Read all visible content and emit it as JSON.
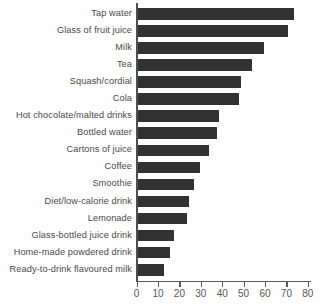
{
  "chart_data": {
    "type": "bar",
    "orientation": "horizontal",
    "title": "",
    "xlabel": "",
    "ylabel": "",
    "categories": [
      "Tap water",
      "Glass of fruit juice",
      "Milk",
      "Tea",
      "Squash/cordial",
      "Cola",
      "Hot chocolate/malted drinks",
      "Bottled water",
      "Cartons of juice",
      "Coffee",
      "Smoothie",
      "Diet/low-calorie drink",
      "Lemonade",
      "Glass-bottled juice drink",
      "Home-made powdered drink",
      "Ready-to-drink flavoured milk"
    ],
    "values": [
      73,
      70,
      59,
      53,
      48,
      47,
      38,
      37,
      33,
      29,
      26,
      24,
      23,
      17,
      15,
      12
    ],
    "xlim": [
      0,
      80
    ],
    "xticks": [
      0,
      10,
      20,
      30,
      40,
      50,
      60,
      70,
      80
    ],
    "grid": false,
    "legend": null,
    "bar_color": "#333233",
    "axis_color": "#5a5a5a",
    "category_label_color": "#4a4a4a",
    "tick_label_color": "#585858",
    "background_color": "#fefefe"
  }
}
